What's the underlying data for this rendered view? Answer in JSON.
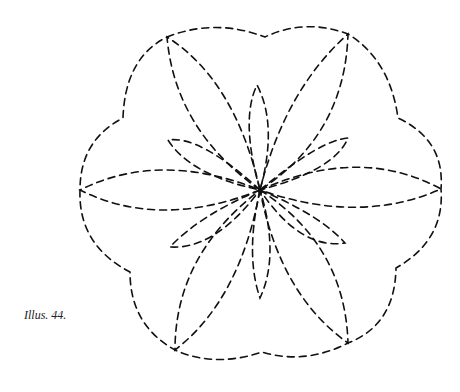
{
  "caption": "Illus. 44.",
  "figure": {
    "stroke_color": "#111111",
    "center": [
      260,
      190
    ],
    "outer_vertices": [
      [
        167,
        37
      ],
      [
        348,
        34
      ],
      [
        441,
        189
      ],
      [
        348,
        343
      ],
      [
        175,
        350
      ],
      [
        80,
        190
      ]
    ],
    "outer_notches": [
      [
        265,
        37
      ],
      [
        398,
        118
      ],
      [
        396,
        268
      ],
      [
        262,
        352
      ],
      [
        130,
        272
      ],
      [
        123,
        118
      ]
    ],
    "small_petal_tips": [
      [
        257,
        85
      ],
      [
        260,
        298
      ],
      [
        168,
        140
      ],
      [
        348,
        138
      ],
      [
        170,
        247
      ],
      [
        345,
        243
      ]
    ]
  }
}
